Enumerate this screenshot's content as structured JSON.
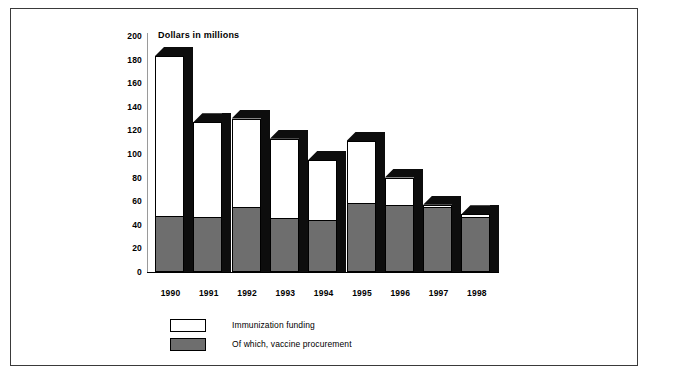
{
  "chart_data": {
    "type": "bar",
    "title": "Dollars in millions",
    "xlabel": "",
    "ylabel": "",
    "ylim": [
      0,
      200
    ],
    "ytick_step": 20,
    "yticks": [
      "200",
      "180",
      "160",
      "140",
      "120",
      "100",
      "80",
      "60",
      "40",
      "20",
      "0"
    ],
    "grid": false,
    "legend_position": "bottom-left",
    "style": "3d-column",
    "categories": [
      "1990",
      "1991",
      "1992",
      "1993",
      "1994",
      "1995",
      "1996",
      "1997",
      "1998"
    ],
    "series": [
      {
        "name": "Immunization funding",
        "color": "#ffffff",
        "values": [
          183,
          127,
          130,
          113,
          95,
          111,
          80,
          57,
          49
        ]
      },
      {
        "name": "Of which, vaccine procurement",
        "color": "#6e6e6e",
        "values": [
          47,
          46,
          54,
          45,
          43,
          58,
          56,
          54,
          46
        ]
      }
    ]
  },
  "legend": {
    "items": [
      {
        "label": "Immunization funding",
        "color": "#ffffff"
      },
      {
        "label": "Of which, vaccine procurement",
        "color": "#6e6e6e"
      }
    ]
  },
  "colors": {
    "bar_fill": "#ffffff",
    "bar_lower_fill": "#6e6e6e",
    "bar_shadow": "#0d0d0d",
    "frame_border": "#3a3a3a",
    "axis": "#9a9a9a"
  }
}
